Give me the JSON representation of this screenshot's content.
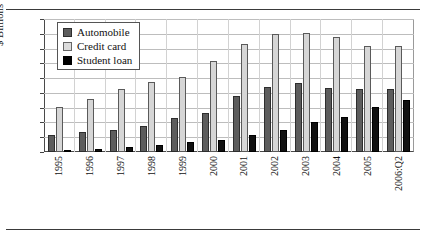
{
  "figure": {
    "has_top_rule": true,
    "has_bottom_rule": true
  },
  "legend": {
    "position": "top-left-inside",
    "entries": [
      {
        "label": "Automobile",
        "color": "#5d5d5d",
        "icon": "square-swatch-dark-gray"
      },
      {
        "label": "Credit card",
        "color": "#dcdcdc",
        "icon": "square-swatch-light-gray"
      },
      {
        "label": "Student loan",
        "color": "#000000",
        "icon": "square-swatch-black"
      }
    ]
  },
  "chart_data": {
    "type": "bar",
    "title": "",
    "xlabel": "",
    "ylabel": "$ Billions",
    "ylim": [
      0,
      450
    ],
    "yticks": [
      0,
      50,
      100,
      150,
      200,
      250,
      300,
      350,
      400,
      450
    ],
    "ytick_labels": [
      "0",
      "50",
      "100",
      "150",
      "200",
      "250",
      "300",
      "350",
      "400",
      "450"
    ],
    "grid": true,
    "legend_position": "upper left",
    "categories": [
      "1995",
      "1996",
      "1997",
      "1998",
      "1999",
      "2000",
      "2001",
      "2002",
      "2003",
      "2004",
      "2005",
      "2006:Q2"
    ],
    "series": [
      {
        "name": "Automobile",
        "color": "#5d5d5d",
        "values": [
          57,
          69,
          76,
          87,
          114,
          132,
          188,
          220,
          233,
          218,
          214,
          213
        ]
      },
      {
        "name": "Credit card",
        "color": "#dcdcdc",
        "values": [
          152,
          180,
          213,
          236,
          255,
          307,
          365,
          400,
          404,
          390,
          360,
          358
        ]
      },
      {
        "name": "Student loan",
        "color": "#000000",
        "values": [
          3,
          9,
          17,
          25,
          35,
          41,
          59,
          74,
          101,
          118,
          152,
          176
        ]
      }
    ]
  }
}
